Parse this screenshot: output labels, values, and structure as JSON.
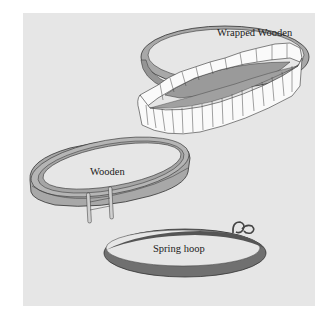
{
  "diagram": {
    "hoops": [
      {
        "id": "wrapped-wooden",
        "label": "Wrapped Wooden"
      },
      {
        "id": "wooden",
        "label": "Wooden"
      },
      {
        "id": "spring",
        "label": "Spring hoop"
      }
    ],
    "colors": {
      "background": "#e6e6e6",
      "wood": "#a8a8a8",
      "wood_dark": "#8c8c8c",
      "spring": "#6f6f6f",
      "wrap": "#fafafa",
      "outline": "#333333"
    }
  }
}
